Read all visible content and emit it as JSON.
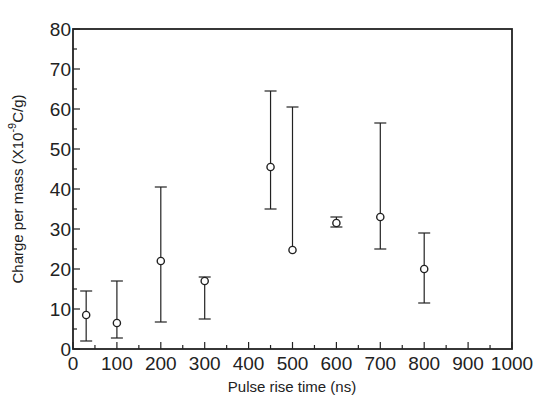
{
  "chart_data": {
    "type": "scatter",
    "title": "",
    "xlabel": "Pulse rise time (ns)",
    "ylabel": "Charge per mass (X10^-9 C/g)",
    "ylabel_parts": {
      "prefix": "Charge per mass (X10",
      "sup": "-9",
      "suffix": "C/g)"
    },
    "xlim": [
      0,
      1000
    ],
    "ylim": [
      0,
      80
    ],
    "x_ticks": [
      0,
      100,
      200,
      300,
      400,
      500,
      600,
      700,
      800,
      900,
      1000
    ],
    "x_tick_labels": [
      "0",
      "100",
      "200",
      "300",
      "400",
      "500",
      "600",
      "700",
      "800",
      "900",
      "1000"
    ],
    "x_minor_step": 50,
    "y_ticks": [
      0,
      10,
      20,
      30,
      40,
      50,
      60,
      70,
      80
    ],
    "y_tick_labels": [
      "0",
      "10",
      "20",
      "30",
      "40",
      "50",
      "60",
      "70",
      "80"
    ],
    "y_minor_step": 5,
    "grid": false,
    "legend": null,
    "marker": "open-circle",
    "series": [
      {
        "name": "Charge per mass",
        "points": [
          {
            "x": 30,
            "y": 8.5,
            "y_low": 2,
            "y_high": 14.5
          },
          {
            "x": 100,
            "y": 6.5,
            "y_low": 2.75,
            "y_high": 17
          },
          {
            "x": 200,
            "y": 22,
            "y_low": 6.75,
            "y_high": 40.5
          },
          {
            "x": 300,
            "y": 17,
            "y_low": 7.5,
            "y_high": 18
          },
          {
            "x": 450,
            "y": 45.5,
            "y_low": 35,
            "y_high": 64.5
          },
          {
            "x": 500,
            "y": 24.75,
            "y_low": 24.75,
            "y_high": 60.5
          },
          {
            "x": 600,
            "y": 31.5,
            "y_low": 30.5,
            "y_high": 33
          },
          {
            "x": 700,
            "y": 33,
            "y_low": 25,
            "y_high": 56.5
          },
          {
            "x": 800,
            "y": 20,
            "y_low": 11.5,
            "y_high": 29
          }
        ]
      }
    ]
  }
}
